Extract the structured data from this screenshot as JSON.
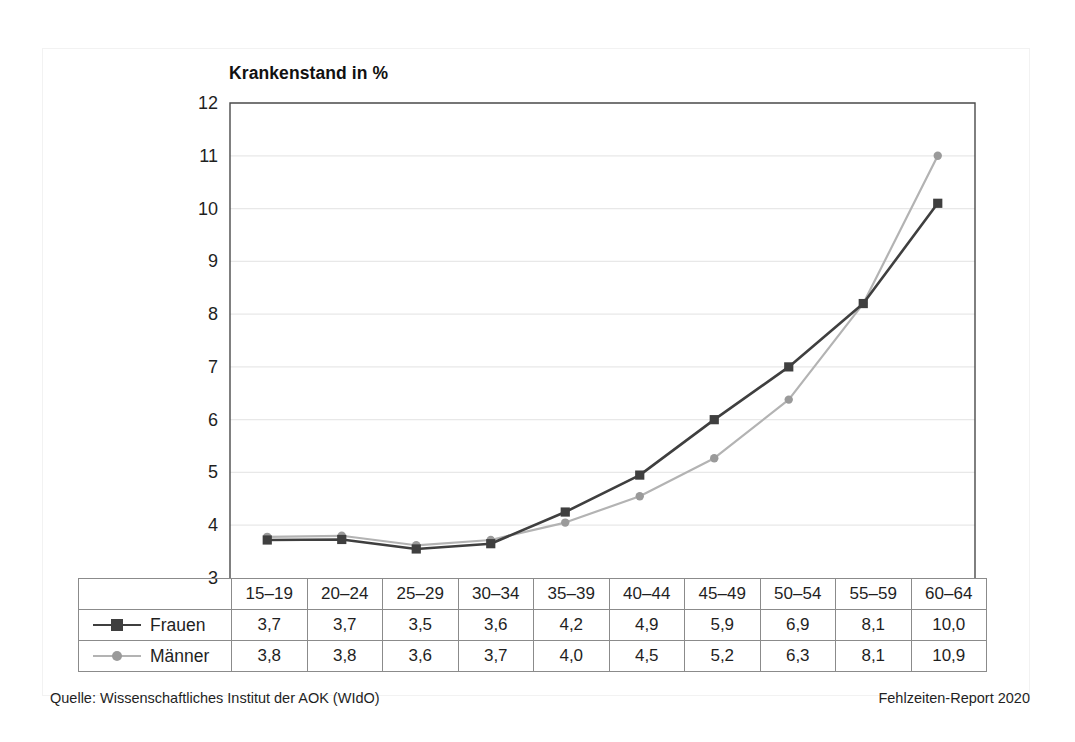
{
  "figure": {
    "axis_title": "Krankenstand in %",
    "source_note": "Quelle: Wissenschaftliches Institut der AOK (WIdO)",
    "report_note": "Fehlzeiten-Report 2020"
  },
  "colors": {
    "frauen_line": "#3f3f3f",
    "maenner_line": "#b3b3b3",
    "maenner_marker": "#9a9a9a",
    "grid": "#e8e8e8",
    "axis": "#4a4a4a",
    "table_border": "#8b8b8b"
  },
  "chart_data": {
    "type": "line",
    "title": "Krankenstand in %",
    "xlabel": "",
    "ylabel": "Krankenstand in %",
    "ylim": [
      3,
      12
    ],
    "yticks": [
      "3",
      "4",
      "5",
      "6",
      "7",
      "8",
      "9",
      "10",
      "11",
      "12"
    ],
    "grid": true,
    "legend_position": "bottom-left-table",
    "categories": [
      "15–19",
      "20–24",
      "25–29",
      "30–34",
      "35–39",
      "40–44",
      "45–49",
      "50–54",
      "55–59",
      "60–64"
    ],
    "series": [
      {
        "name": "Frauen",
        "marker": "square",
        "labels": [
          "3,7",
          "3,7",
          "3,5",
          "3,6",
          "4,2",
          "4,9",
          "5,9",
          "6,9",
          "8,1",
          "10,0"
        ],
        "values": [
          3.7,
          3.7,
          3.5,
          3.6,
          4.2,
          4.9,
          5.9,
          6.9,
          8.1,
          10.0
        ],
        "plotted": [
          3.72,
          3.73,
          3.55,
          3.65,
          4.25,
          4.95,
          6.0,
          7.0,
          8.2,
          10.1
        ]
      },
      {
        "name": "Männer",
        "marker": "circle",
        "labels": [
          "3,8",
          "3,8",
          "3,6",
          "3,7",
          "4,0",
          "4,5",
          "5,2",
          "6,3",
          "8,1",
          "10,9"
        ],
        "values": [
          3.8,
          3.8,
          3.6,
          3.7,
          4.0,
          4.5,
          5.2,
          6.3,
          8.1,
          10.9
        ],
        "plotted": [
          3.78,
          3.8,
          3.62,
          3.72,
          4.05,
          4.55,
          5.27,
          6.38,
          8.2,
          11.0
        ]
      }
    ]
  }
}
